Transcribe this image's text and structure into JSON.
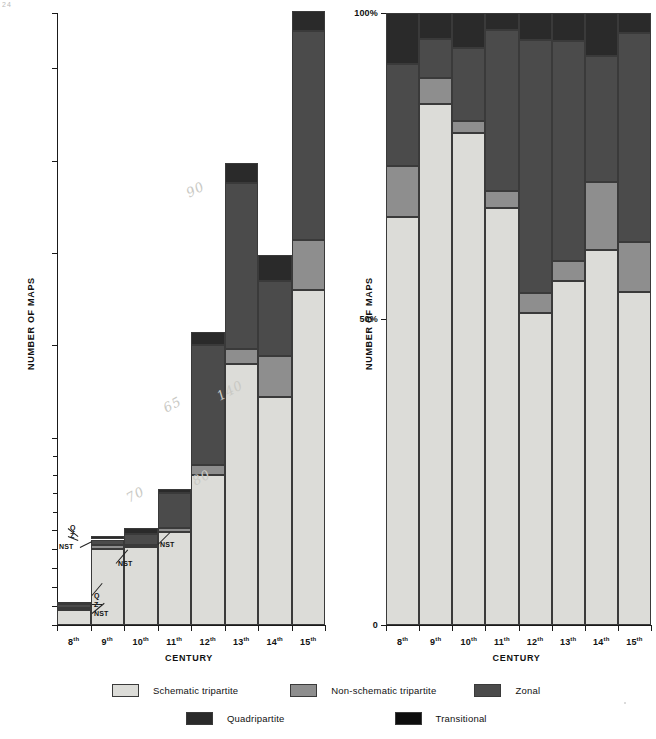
{
  "page": {
    "corner_mark": "24"
  },
  "chart_data": [
    {
      "id": "counts",
      "type": "bar",
      "subtype": "stacked",
      "title": "",
      "xlabel": "CENTURY",
      "ylabel": "NUMBER OF MAPS",
      "categories": [
        "8th",
        "9th",
        "10th",
        "11th",
        "12th",
        "13th",
        "14th",
        "15th"
      ],
      "ytick_labels": [
        "0",
        "10",
        "20",
        "30",
        "40",
        "50",
        "100",
        "150",
        "200",
        "250",
        "300",
        "330"
      ],
      "ytick_values": [
        0,
        10,
        20,
        30,
        40,
        50,
        100,
        150,
        200,
        250,
        300,
        330
      ],
      "yaxis_note": "broken/compressed scale above 50",
      "ylim": [
        0,
        330
      ],
      "grid": false,
      "legend_position": "bottom",
      "series": [
        {
          "name": "Schematic tripartite",
          "color": "#dcdcd8",
          "values": [
            8,
            40,
            41,
            49,
            80,
            140,
            122,
            180
          ]
        },
        {
          "name": "Non-schematic tripartite",
          "color": "#8e8e8e",
          "values": [
            1,
            2,
            1,
            2,
            5,
            8,
            22,
            27
          ]
        },
        {
          "name": "Zonal",
          "color": "#4b4b4b",
          "values": [
            2,
            3,
            6,
            19,
            65,
            90,
            41,
            113
          ]
        },
        {
          "name": "Quadripartite",
          "color": "#2a2a2a",
          "values": [
            1,
            2,
            3,
            2,
            7,
            11,
            14,
            11
          ]
        },
        {
          "name": "Transitional",
          "color": "#0d0d0d",
          "values": [
            0,
            0,
            0,
            0,
            0,
            0,
            0,
            0
          ]
        }
      ],
      "totals": [
        12,
        47,
        51,
        72,
        157,
        249,
        199,
        331
      ],
      "annotations": [
        {
          "text": "70",
          "series": "total",
          "century": "11th"
        },
        {
          "text": "80",
          "series": "Schematic tripartite",
          "century": "12th"
        },
        {
          "text": "65",
          "series": "Zonal",
          "century": "12th"
        },
        {
          "text": "140",
          "series": "Schematic tripartite",
          "century": "13th"
        },
        {
          "text": "90",
          "series": "Zonal",
          "century": "13th"
        }
      ],
      "callouts": [
        {
          "century": "8th",
          "labels": [
            "Q",
            "Z",
            "NST"
          ]
        },
        {
          "century": "9th",
          "labels": [
            "Q",
            "Z",
            "NST"
          ]
        },
        {
          "century": "10th",
          "labels": [
            "NST"
          ]
        },
        {
          "century": "11th",
          "labels": [
            "NST"
          ]
        }
      ]
    },
    {
      "id": "percentages",
      "type": "bar",
      "subtype": "stacked-100-percent",
      "title": "",
      "xlabel": "CENTURY",
      "ylabel": "NUMBER OF MAPS",
      "categories": [
        "8th",
        "9th",
        "10th",
        "11th",
        "12th",
        "13th",
        "14th",
        "15th"
      ],
      "ytick_labels": [
        "0",
        "50%",
        "100%"
      ],
      "ytick_values": [
        0,
        50,
        100
      ],
      "ylim": [
        0,
        100
      ],
      "grid": false,
      "legend_position": "bottom",
      "series": [
        {
          "name": "Schematic tripartite",
          "color": "#dcdcd8",
          "values": [
            66.7,
            85.1,
            80.4,
            68.1,
            51.0,
            56.2,
            61.3,
            54.4
          ]
        },
        {
          "name": "Non-schematic tripartite",
          "color": "#8e8e8e",
          "values": [
            8.3,
            4.3,
            2.0,
            2.8,
            3.2,
            3.2,
            11.1,
            8.2
          ]
        },
        {
          "name": "Zonal",
          "color": "#4b4b4b",
          "values": [
            16.7,
            6.4,
            11.8,
            26.4,
            41.4,
            36.1,
            20.6,
            34.1
          ]
        },
        {
          "name": "Quadripartite",
          "color": "#2a2a2a",
          "values": [
            8.3,
            4.2,
            5.8,
            2.7,
            4.4,
            4.5,
            7.0,
            3.3
          ]
        },
        {
          "name": "Transitional",
          "color": "#0d0d0d",
          "values": [
            0,
            0,
            0,
            0,
            0,
            0,
            0,
            0
          ]
        }
      ]
    }
  ],
  "legend": {
    "row1": [
      {
        "label": "Schematic tripartite",
        "color": "#dcdcd8"
      },
      {
        "label": "Non-schematic tripartite",
        "color": "#8e8e8e"
      },
      {
        "label": "Zonal",
        "color": "#4b4b4b"
      }
    ],
    "row2": [
      {
        "label": "Quadripartite",
        "color": "#2a2a2a"
      },
      {
        "label": "Transitional",
        "color": "#0d0d0d"
      }
    ]
  }
}
